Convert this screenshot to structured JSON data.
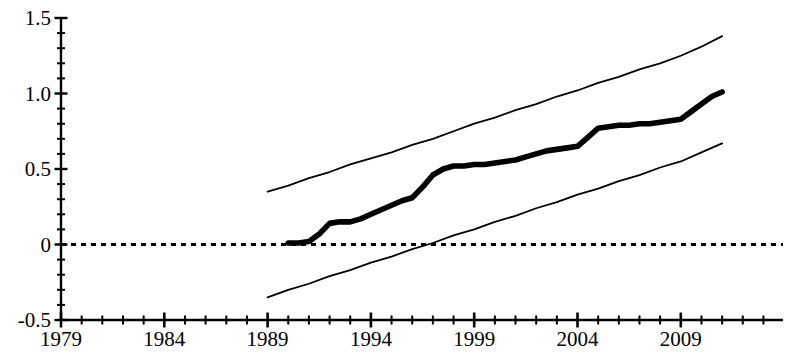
{
  "chart_data": {
    "type": "line",
    "title": "",
    "subtitle": "",
    "xlabel": "",
    "ylabel": "",
    "xlim": [
      1979,
      2014
    ],
    "ylim": [
      -0.5,
      1.5
    ],
    "grid": false,
    "legend_position": "none",
    "x_tick_labels": [
      "1979",
      "1984",
      "1989",
      "1994",
      "1999",
      "2004",
      "2009"
    ],
    "x_tick_values": [
      1979,
      1984,
      1989,
      1994,
      1999,
      2004,
      2009
    ],
    "x_minor_tick_interval": 1,
    "y_tick_labels": [
      "1.5",
      "1.0",
      "0.5",
      "0",
      "-0.5"
    ],
    "y_tick_values": [
      1.5,
      1.0,
      0.5,
      0,
      -0.5
    ],
    "y_minor_tick_interval": 0.1,
    "reference_line": {
      "name": "zero-line",
      "value": 0,
      "style": "dashed",
      "color": "#000000"
    },
    "series": [
      {
        "name": "upper-confidence-band",
        "style": "thin-solid",
        "color": "#000000",
        "x": [
          1989.0,
          1990.0,
          1991.0,
          1992.0,
          1993.0,
          1994.0,
          1995.0,
          1996.0,
          1997.0,
          1998.0,
          1999.0,
          2000.0,
          2001.0,
          2002.0,
          2003.0,
          2004.0,
          2005.0,
          2006.0,
          2007.0,
          2008.0,
          2009.0,
          2010.0,
          2011.0
        ],
        "values": [
          0.35,
          0.39,
          0.44,
          0.48,
          0.53,
          0.57,
          0.61,
          0.66,
          0.7,
          0.75,
          0.8,
          0.84,
          0.89,
          0.93,
          0.98,
          1.02,
          1.07,
          1.11,
          1.16,
          1.2,
          1.25,
          1.31,
          1.38
        ]
      },
      {
        "name": "point-estimate",
        "style": "thick-solid",
        "color": "#000000",
        "x": [
          1990.0,
          1990.5,
          1991.0,
          1991.5,
          1992.0,
          1992.5,
          1993.0,
          1993.5,
          1994.0,
          1994.5,
          1995.0,
          1995.5,
          1996.0,
          1996.5,
          1997.0,
          1997.5,
          1998.0,
          1998.5,
          1999.0,
          1999.5,
          2000.0,
          2000.5,
          2001.0,
          2001.5,
          2002.0,
          2002.5,
          2003.0,
          2003.5,
          2004.0,
          2004.5,
          2005.0,
          2005.5,
          2006.0,
          2006.5,
          2007.0,
          2007.5,
          2008.0,
          2008.5,
          2009.0,
          2009.5,
          2010.0,
          2010.5,
          2011.0
        ],
        "values": [
          0.01,
          0.01,
          0.02,
          0.07,
          0.14,
          0.15,
          0.15,
          0.17,
          0.2,
          0.23,
          0.26,
          0.29,
          0.31,
          0.38,
          0.46,
          0.5,
          0.52,
          0.52,
          0.53,
          0.53,
          0.54,
          0.55,
          0.56,
          0.58,
          0.6,
          0.62,
          0.63,
          0.64,
          0.65,
          0.71,
          0.77,
          0.78,
          0.79,
          0.79,
          0.8,
          0.8,
          0.81,
          0.82,
          0.83,
          0.88,
          0.93,
          0.98,
          1.01
        ]
      },
      {
        "name": "lower-confidence-band",
        "style": "thin-solid",
        "color": "#000000",
        "x": [
          1989.0,
          1990.0,
          1991.0,
          1992.0,
          1993.0,
          1994.0,
          1995.0,
          1996.0,
          1997.0,
          1998.0,
          1999.0,
          2000.0,
          2001.0,
          2002.0,
          2003.0,
          2004.0,
          2005.0,
          2006.0,
          2007.0,
          2008.0,
          2009.0,
          2010.0,
          2011.0
        ],
        "values": [
          -0.35,
          -0.3,
          -0.26,
          -0.21,
          -0.17,
          -0.12,
          -0.08,
          -0.03,
          0.01,
          0.06,
          0.1,
          0.15,
          0.19,
          0.24,
          0.28,
          0.33,
          0.37,
          0.42,
          0.46,
          0.51,
          0.55,
          0.61,
          0.67
        ]
      }
    ]
  }
}
